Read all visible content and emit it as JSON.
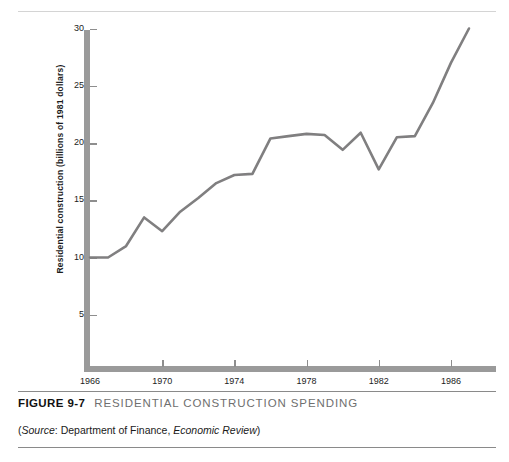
{
  "figure": {
    "number": "FIGURE 9-7",
    "title": "RESIDENTIAL CONSTRUCTION SPENDING",
    "source_prefix": "(",
    "source_label": "Source",
    "source_sep": ": ",
    "source_org": "Department of Finance, ",
    "source_pub": "Economic Review",
    "source_suffix": ")"
  },
  "chart_data": {
    "type": "line",
    "title": "RESIDENTIAL CONSTRUCTION SPENDING",
    "xlabel": "",
    "ylabel": "Residential construction (billions of 1981 dollars)",
    "xlim": [
      1966,
      1987.5
    ],
    "ylim": [
      0,
      31.5
    ],
    "grid": false,
    "legend": null,
    "line_color": "#807f80",
    "axis_color": "#9a9a9a",
    "xticks": [
      1966,
      1970,
      1974,
      1978,
      1982,
      1986
    ],
    "xticklabels": [
      "1966",
      "1970",
      "1974",
      "1978",
      "1982",
      "1986"
    ],
    "yticks": [
      5,
      10,
      15,
      20,
      25,
      30
    ],
    "yticklabels": [
      "5",
      "10",
      "15",
      "20",
      "25",
      "30"
    ],
    "x": [
      1966,
      1967,
      1968,
      1969,
      1970,
      1971,
      1972,
      1973,
      1974,
      1975,
      1976,
      1977,
      1978,
      1979,
      1980,
      1981,
      1982,
      1983,
      1984,
      1985,
      1986,
      1987
    ],
    "values": [
      10.0,
      10.0,
      11.0,
      13.5,
      12.3,
      14.0,
      15.2,
      16.5,
      17.2,
      17.3,
      20.4,
      20.6,
      20.8,
      20.7,
      19.4,
      20.9,
      17.7,
      20.5,
      20.6,
      23.5,
      27.0,
      30.0
    ]
  }
}
